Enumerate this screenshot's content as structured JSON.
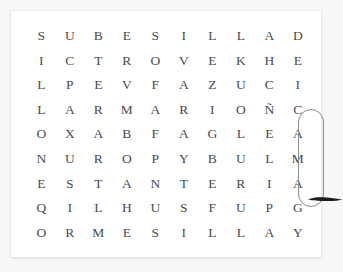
{
  "app": {
    "title": "Word Search Puzzle",
    "theme_accent": "#8c8c8c",
    "letter_color": "#4b4b4f",
    "card_background": "#ffffff",
    "page_background": "#f7f7f7"
  },
  "puzzle": {
    "rows": 9,
    "columns": 10,
    "grid": [
      [
        "S",
        "U",
        "B",
        "E",
        "S",
        "I",
        "L",
        "L",
        "A",
        "D"
      ],
      [
        "I",
        "C",
        "T",
        "R",
        "O",
        "V",
        "E",
        "K",
        "H",
        "E"
      ],
      [
        "L",
        "P",
        "E",
        "V",
        "F",
        "A",
        "Z",
        "U",
        "C",
        "I"
      ],
      [
        "L",
        "A",
        "R",
        "M",
        "A",
        "R",
        "I",
        "O",
        "Ñ",
        "C"
      ],
      [
        "O",
        "X",
        "A",
        "B",
        "F",
        "A",
        "G",
        "L",
        "E",
        "A"
      ],
      [
        "N",
        "U",
        "R",
        "O",
        "P",
        "Y",
        "B",
        "U",
        "L",
        "M"
      ],
      [
        "E",
        "S",
        "T",
        "A",
        "N",
        "T",
        "E",
        "R",
        "I",
        "A"
      ],
      [
        "Q",
        "I",
        "L",
        "H",
        "U",
        "S",
        "F",
        "U",
        "P",
        "G"
      ],
      [
        "O",
        "R",
        "M",
        "E",
        "S",
        "I",
        "L",
        "L",
        "A",
        "Y"
      ]
    ],
    "found_word": {
      "text": "CAMA",
      "orientation": "vertical",
      "start_row": 4,
      "start_column": 10,
      "end_row": 7,
      "end_column": 10,
      "marker": "rounded-outline"
    },
    "annotation": {
      "type": "drag-stroke",
      "color": "#1d1d1d",
      "near_cell": "A"
    }
  }
}
